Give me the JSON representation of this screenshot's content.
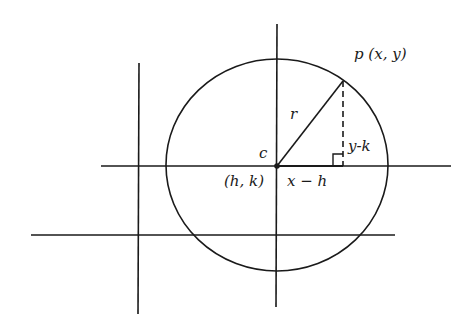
{
  "diagram": {
    "type": "circle-distance-formula",
    "labels": {
      "point": "p (x, y)",
      "radius": "r",
      "center_name": "c",
      "center_coords": "(h, k)",
      "horizontal_leg": "x − h",
      "vertical_leg": "y-k"
    },
    "colors": {
      "stroke": "#1a1a1a",
      "background": "#ffffff"
    }
  }
}
